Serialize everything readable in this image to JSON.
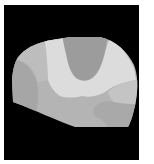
{
  "image": {
    "description": "Grayscale segmentation map of a brain-like cross-section on a black background",
    "background_color": "#000000",
    "page_color": "#ffffff",
    "regions": [
      {
        "name": "base-region",
        "color": "#b4b4b4"
      },
      {
        "name": "left-region",
        "color": "#a6a6a6"
      },
      {
        "name": "upper-left-region",
        "color": "#bdbdbd"
      },
      {
        "name": "bright-band-region",
        "color": "#dcdcdc"
      },
      {
        "name": "top-center-region",
        "color": "#9c9c9c"
      },
      {
        "name": "lower-right-region",
        "color": "#a9a9a9"
      },
      {
        "name": "right-region",
        "color": "#c4c4c4"
      }
    ]
  }
}
